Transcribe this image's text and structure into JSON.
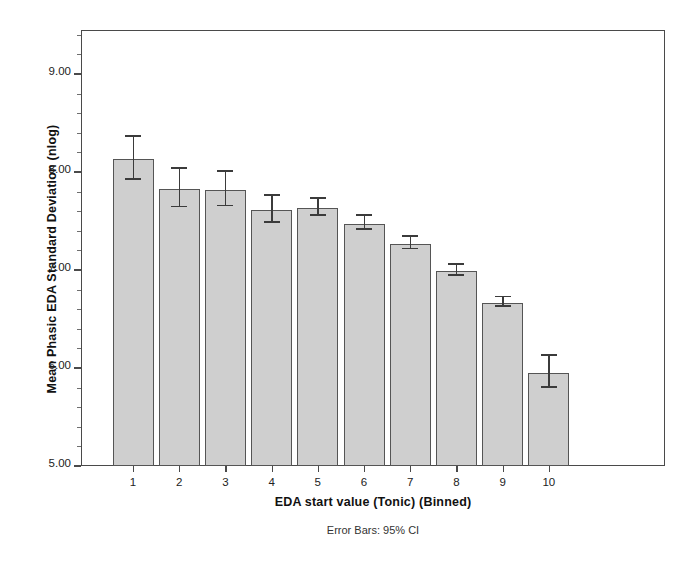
{
  "chart_data": {
    "type": "bar",
    "title": "",
    "xlabel": "EDA start value (Tonic) (Binned)",
    "ylabel": "Mean Phasic EDA Standard Deviation (nlog)",
    "footnote": "Error Bars: 95% CI",
    "categories": [
      "1",
      "2",
      "3",
      "4",
      "5",
      "6",
      "7",
      "8",
      "9",
      "10"
    ],
    "values": [
      8.13,
      7.83,
      7.82,
      7.61,
      7.63,
      7.47,
      7.27,
      6.99,
      6.66,
      5.95
    ],
    "error_low": [
      7.92,
      7.64,
      7.65,
      7.48,
      7.55,
      7.41,
      7.21,
      6.94,
      6.62,
      5.8
    ],
    "error_high": [
      8.36,
      8.03,
      8.0,
      7.76,
      7.73,
      7.55,
      7.34,
      7.05,
      6.72,
      6.12
    ],
    "error_type": "95% CI",
    "ylim": [
      5.0,
      9.45
    ],
    "ytick_values": [
      5.0,
      6.0,
      7.0,
      8.0,
      9.0
    ],
    "ytick_labels": [
      "5.00",
      "6.00",
      "7.00",
      "8.00",
      "9.00"
    ],
    "grid": false,
    "legend": "none",
    "bar_fill_color": "#cfcfcf",
    "bar_edge_color": "#555555",
    "error_color": "#3b3b3b",
    "axis_color": "#4a4a4a",
    "background_color": "#ffffff"
  }
}
